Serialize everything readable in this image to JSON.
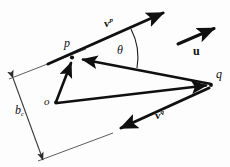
{
  "figure": {
    "type": "vector-geometry-diagram",
    "background_color": "#fdfdfd",
    "stroke_color": "#101010",
    "width": 230,
    "height": 167,
    "points": [
      {
        "id": "p",
        "label": "p",
        "x": 72,
        "y": 57
      },
      {
        "id": "q",
        "label": "q",
        "x": 212,
        "y": 85
      },
      {
        "id": "o",
        "label": "o",
        "x": 56,
        "y": 103
      }
    ],
    "vectors": [
      {
        "id": "vp",
        "label": "v",
        "superscript": "p",
        "from": {
          "x": 48,
          "y": 64
        },
        "to": {
          "x": 170,
          "y": 10
        },
        "style": "thick-solid-arrow"
      },
      {
        "id": "vq",
        "label": "v",
        "superscript": "q",
        "from": {
          "x": 209,
          "y": 88
        },
        "to": {
          "x": 114,
          "y": 132
        },
        "style": "thick-solid-arrow"
      },
      {
        "id": "u",
        "label": "u",
        "superscript": "",
        "from": {
          "x": 178,
          "y": 44
        },
        "to": {
          "x": 220,
          "y": 26
        },
        "style": "thick-solid-arrow"
      },
      {
        "id": "qp",
        "label": "",
        "superscript": "",
        "from": {
          "x": 211,
          "y": 84
        },
        "to": {
          "x": 76,
          "y": 58
        },
        "style": "thick-solid-arrow"
      },
      {
        "id": "op",
        "label": "",
        "superscript": "",
        "from": {
          "x": 56,
          "y": 102
        },
        "to": {
          "x": 72,
          "y": 58
        },
        "style": "thick-solid-arrow"
      },
      {
        "id": "oq",
        "label": "",
        "superscript": "",
        "from": {
          "x": 57,
          "y": 103
        },
        "to": {
          "x": 210,
          "y": 85
        },
        "style": "thick-solid-arrow"
      }
    ],
    "angle": {
      "id": "theta",
      "label": "θ",
      "vertex": {
        "x": 72,
        "y": 57
      },
      "arc_radius": 62,
      "between": [
        "vp",
        "qp"
      ]
    },
    "dimension": {
      "id": "bc",
      "label": "b",
      "subscript": "c",
      "from": {
        "x": 13,
        "y": 78
      },
      "to": {
        "x": 43,
        "y": 160
      },
      "style": "double-headed-thin-arrow",
      "extension_lines": [
        {
          "from": {
            "x": 9,
            "y": 79
          },
          "to": {
            "x": 86,
            "y": 49
          }
        },
        {
          "from": {
            "x": 38,
            "y": 161
          },
          "to": {
            "x": 113,
            "y": 133
          }
        }
      ]
    }
  }
}
